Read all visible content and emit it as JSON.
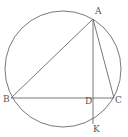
{
  "diagram": {
    "type": "geometry",
    "stroke_color": "#6a6a6a",
    "circle": {
      "cx": 63,
      "cy": 69,
      "r": 58
    },
    "points": {
      "A": {
        "label": "A",
        "x": 93,
        "y": 19,
        "lx": 95,
        "ly": 14
      },
      "B": {
        "label": "B",
        "x": 11,
        "y": 98,
        "lx": 3,
        "ly": 102
      },
      "C": {
        "label": "C",
        "x": 114,
        "y": 98,
        "lx": 115,
        "ly": 103
      },
      "D": {
        "label": "D",
        "x": 93,
        "y": 98,
        "lx": 85,
        "ly": 104
      },
      "K": {
        "label": "K",
        "x": 93,
        "y": 124,
        "lx": 93,
        "ly": 132
      }
    },
    "segments": [
      {
        "name": "AB",
        "from": "A",
        "to": "B"
      },
      {
        "name": "AC",
        "from": "A",
        "to": "C"
      },
      {
        "name": "BC",
        "from": "B",
        "to": "C"
      },
      {
        "name": "AK",
        "from": "A",
        "to": "K"
      }
    ]
  }
}
